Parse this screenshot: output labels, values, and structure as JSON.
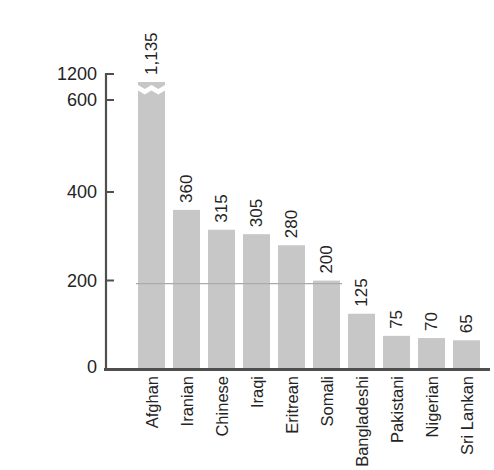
{
  "figure": {
    "background": "#ffffff"
  },
  "chart_data": {
    "type": "bar",
    "title": "",
    "xlabel": "",
    "ylabel": "",
    "categories": [
      "Afghan",
      "Iranian",
      "Chinese",
      "Iraqi",
      "Eritrean",
      "Somali",
      "Bangladeshi",
      "Pakistani",
      "Nigerian",
      "Sri Lankan"
    ],
    "values": [
      1135,
      360,
      315,
      305,
      280,
      200,
      125,
      75,
      70,
      65
    ],
    "value_labels": [
      "1,135",
      "360",
      "315",
      "305",
      "280",
      "200",
      "125",
      "75",
      "70",
      "65"
    ],
    "y_ticks": [
      0,
      200,
      400,
      600,
      1200
    ],
    "y_tick_labels": [
      "0",
      "200",
      "400",
      "600",
      "1200"
    ],
    "ylim": [
      0,
      1200
    ],
    "axis_break": {
      "present": true,
      "between": [
        600,
        1200
      ],
      "broken_bar": "Afghan"
    },
    "reference_line": {
      "value": 200
    },
    "grid": "off",
    "legend": "none",
    "x_tick_label_rotation": 90,
    "value_label_rotation": 90,
    "bar_color": "#c7c7c7",
    "axis_color": "#4f4f4f",
    "text_color": "#242424",
    "reference_line_color": "#ababab"
  }
}
